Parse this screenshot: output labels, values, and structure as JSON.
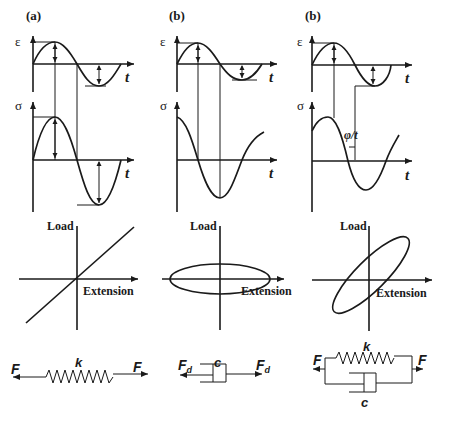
{
  "figure": {
    "columns": [
      {
        "panel_label": "(a)",
        "strain_symbol": "ε",
        "stress_symbol": "σ",
        "time_label": "t",
        "load_label": "Load",
        "extension_label": "Extension",
        "model": {
          "element": "spring",
          "constant_label": "k",
          "force_left": "F",
          "force_right": "F"
        },
        "description": "Elastic: stress in phase with strain; straight-line load–extension"
      },
      {
        "panel_label": "(b)",
        "strain_symbol": "ε",
        "stress_symbol": "σ",
        "time_label": "t",
        "load_label": "Load",
        "extension_label": "Extension",
        "model": {
          "element": "dashpot",
          "constant_label": "c",
          "force_left": "F",
          "force_left_sub": "d",
          "force_right": "F",
          "force_right_sub": "d"
        },
        "description": "Viscous: stress 90° out of phase with strain; horizontal ellipse"
      },
      {
        "panel_label": "(b)",
        "strain_symbol": "ε",
        "stress_symbol": "σ",
        "time_label": "t",
        "phase_label": "φ/t",
        "load_label": "Load",
        "extension_label": "Extension",
        "model": {
          "element": "spring-dashpot-parallel",
          "spring_label": "k",
          "dashpot_label": "c",
          "force_left": "F",
          "force_right": "F"
        },
        "description": "Viscoelastic: stress leads strain by phase φ; tilted ellipse"
      }
    ]
  }
}
